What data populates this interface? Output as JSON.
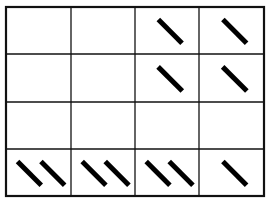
{
  "diagram": {
    "type": "tally-grid",
    "rows": 4,
    "cols": 4,
    "colors": {
      "line": "#111111",
      "mark": "#000000",
      "background": "#ffffff"
    },
    "frame": {
      "x": 6,
      "y": 7,
      "w": 258,
      "h": 189
    },
    "col_edges": [
      6,
      71,
      135,
      199,
      264
    ],
    "row_edges": [
      7,
      54,
      102,
      149,
      196
    ],
    "cells": [
      [
        0,
        0,
        1,
        1
      ],
      [
        0,
        0,
        1,
        1
      ],
      [
        0,
        0,
        0,
        0
      ],
      [
        2,
        2,
        2,
        1
      ]
    ],
    "mark_icon": "diagonal-stroke"
  }
}
